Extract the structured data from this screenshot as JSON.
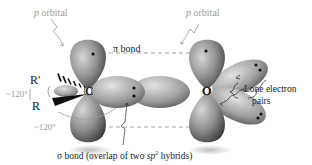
{
  "diagram": {
    "atoms": {
      "carbon": "C",
      "oxygen": "O",
      "substituent_top": "R′",
      "substituent_bottom": "R"
    },
    "labels": {
      "p_orbital_left": {
        "italic": "p",
        "text": " orbital"
      },
      "p_orbital_right": {
        "italic": "p",
        "text": " orbital"
      },
      "pi_bond": {
        "symbol": "π",
        "text": " bond"
      },
      "angle_top": "~120°",
      "angle_bottom": "~120°",
      "lone_pairs_line1": "Lone electron",
      "lone_pairs_line2": "pairs",
      "sigma_bond": {
        "symbol": "σ",
        "text": " bond (overlap of two ",
        "italic": "sp",
        "sup": "2",
        "tail": " hybrids)"
      }
    },
    "colors": {
      "lobe_light": "#c8c8c8",
      "lobe_mid": "#8a8a8a",
      "lobe_dark": "#4a4a4a",
      "label_gray": "#9a9a9a",
      "label_dark": "#222222",
      "dash": "#8a8a8a"
    }
  }
}
